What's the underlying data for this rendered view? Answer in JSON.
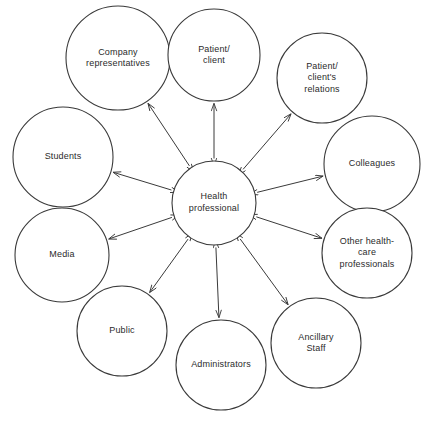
{
  "diagram": {
    "type": "hub-and-spoke",
    "stroke_color": "#3a3a3a",
    "background_color": "#ffffff",
    "text_color": "#2b2b2b",
    "center": {
      "id": "health-professional",
      "label_lines": [
        "Health",
        "professional"
      ],
      "line1": "Health",
      "line2": "professional",
      "cx": 214,
      "cy": 203,
      "r": 42
    },
    "nodes": [
      {
        "id": "company-representatives",
        "line1": "Company",
        "line2": "representatives",
        "line3": "",
        "cx": 118,
        "cy": 58,
        "r": 52,
        "arrow": "bidirectional"
      },
      {
        "id": "patient-client",
        "line1": "Patient/",
        "line2": "client",
        "line3": "",
        "cx": 214,
        "cy": 55,
        "r": 46,
        "arrow": "bidirectional"
      },
      {
        "id": "patient-client-relations",
        "line1": "Patient/",
        "line2": "client's",
        "line3": "relations",
        "cx": 322,
        "cy": 78,
        "r": 45,
        "arrow": "bidirectional"
      },
      {
        "id": "colleagues",
        "line1": "Colleagues",
        "line2": "",
        "line3": "",
        "cx": 372,
        "cy": 164,
        "r": 48,
        "arrow": "bidirectional"
      },
      {
        "id": "other-health-care-professionals",
        "line1": "Other health-",
        "line2": "care",
        "line3": "professionals",
        "cx": 367,
        "cy": 253,
        "r": 45,
        "arrow": "bidirectional"
      },
      {
        "id": "ancillary-staff",
        "line1": "Ancillary",
        "line2": "Staff",
        "line3": "",
        "cx": 316,
        "cy": 343,
        "r": 45,
        "arrow": "bidirectional"
      },
      {
        "id": "administrators",
        "line1": "Administrators",
        "line2": "",
        "line3": "",
        "cx": 221,
        "cy": 365,
        "r": 45,
        "arrow": "bidirectional"
      },
      {
        "id": "public",
        "line1": "Public",
        "line2": "",
        "line3": "",
        "cx": 122,
        "cy": 331,
        "r": 45,
        "arrow": "bidirectional"
      },
      {
        "id": "media",
        "line1": "Media",
        "line2": "",
        "line3": "",
        "cx": 62,
        "cy": 255,
        "r": 47,
        "arrow": "bidirectional"
      },
      {
        "id": "students",
        "line1": "Students",
        "line2": "",
        "line3": "",
        "cx": 63,
        "cy": 157,
        "r": 50,
        "arrow": "bidirectional"
      }
    ]
  }
}
